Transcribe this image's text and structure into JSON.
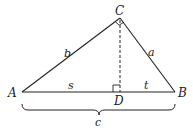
{
  "diagram": {
    "type": "right-triangle-altitude",
    "stroke_color": "#222222",
    "vertices": [
      {
        "id": "A",
        "label": "A",
        "x": 22,
        "y": 92
      },
      {
        "id": "B",
        "label": "B",
        "x": 175,
        "y": 92
      },
      {
        "id": "C",
        "label": "C",
        "x": 120,
        "y": 18
      },
      {
        "id": "D",
        "label": "D",
        "x": 120,
        "y": 92
      }
    ],
    "sides": {
      "b": "b",
      "a": "a",
      "s": "s",
      "t": "t",
      "c": "c"
    },
    "right_angles": [
      "C",
      "D"
    ]
  }
}
